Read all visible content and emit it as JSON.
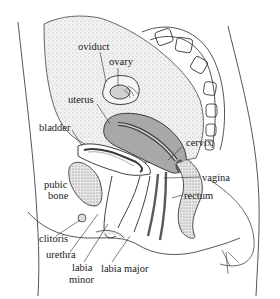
{
  "diagram": {
    "colors": {
      "line": "#2a2a2a",
      "peritoneum_stipple": "#d9d9d9",
      "uterus_fill": "#a8a8a8",
      "uterus_lumen": "#5a5a5a",
      "bone_fill": "#e4e4e4",
      "background": "#ffffff"
    },
    "labels": {
      "oviduct": "oviduct",
      "ovary": "ovary",
      "uterus": "uterus",
      "bladder": "bladder",
      "cervix": "cervix",
      "vagina": "vagina",
      "rectum": "rectum",
      "pubic": "pubic",
      "bone": "bone",
      "clitoris": "clitoris",
      "urethra": "urethra",
      "labia_minor_1": "labia",
      "labia_minor_2": "minor",
      "labia_major": "labia major"
    }
  }
}
